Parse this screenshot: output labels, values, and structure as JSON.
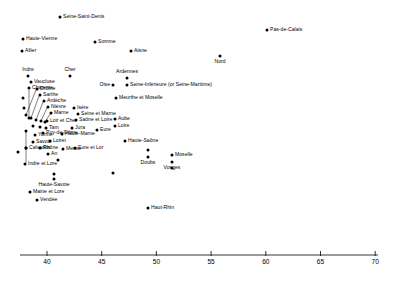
{
  "chart_data": {
    "type": "scatter",
    "title": "",
    "xlabel": "",
    "ylabel": "",
    "xlim": [
      38.0,
      71.0
    ],
    "ylim": [
      0,
      1
    ],
    "grid": false,
    "legend": null,
    "axis_ticks": [
      40,
      45,
      50,
      55,
      60,
      65,
      70
    ],
    "axis_tick_labels": [
      "40",
      "45",
      "50",
      "55",
      "60",
      "65",
      "70"
    ],
    "note": "One-dimensional dot plot of French departments; vertical position is label-placement jitter only, horizontal position is the measured value.",
    "points": [
      {
        "label": "Seine-Saint-Denis",
        "x": 44.3,
        "px": 60,
        "py": 17,
        "side": "right"
      },
      {
        "label": "Haute-Vienne",
        "x": 40.7,
        "px": 23,
        "py": 39,
        "side": "right"
      },
      {
        "label": "Somme",
        "x": 48.0,
        "px": 95,
        "py": 42,
        "side": "right"
      },
      {
        "label": "Allier",
        "x": 40.5,
        "px": 22,
        "py": 51,
        "side": "right"
      },
      {
        "label": "Aisne",
        "x": 51.4,
        "px": 131,
        "py": 51,
        "side": "right"
      },
      {
        "label": "Nord",
        "x": 56.1,
        "px": 220,
        "py": 56,
        "side": "below"
      },
      {
        "label": "Pas-de-Calais",
        "x": 60.6,
        "px": 267,
        "py": 30,
        "side": "right"
      },
      {
        "label": "Indre",
        "x": 40.2,
        "px": 28,
        "py": 76,
        "side": "above"
      },
      {
        "label": "Cher",
        "x": 44.3,
        "px": 70,
        "py": 76,
        "side": "above"
      },
      {
        "label": "Vaucluse",
        "x": 40.4,
        "px": 31,
        "py": 82,
        "side": "right"
      },
      {
        "label": "Ardennes",
        "x": 52.3,
        "px": 127,
        "py": 78,
        "side": "above"
      },
      {
        "label": "Oise",
        "x": 51.0,
        "px": 113,
        "py": 85,
        "side": "left"
      },
      {
        "label": "Seine-Inférieure (or Seine-Maritime)",
        "x": 52.3,
        "px": 127,
        "py": 85,
        "side": "right"
      },
      {
        "label": "Charente",
        "x": 40.3,
        "px": 29,
        "py": 88,
        "side": "leader-v"
      },
      {
        "label": "Drôme",
        "x": 41.2,
        "px": 37,
        "py": 89,
        "side": "leader"
      },
      {
        "label": "Sarthe",
        "x": 41.4,
        "px": 40,
        "py": 95,
        "side": "leader"
      },
      {
        "label": "Meurthe et Moselle",
        "x": 51.2,
        "px": 116,
        "py": 98,
        "side": "right"
      },
      {
        "label": "Ardèche",
        "x": 41.8,
        "px": 44,
        "py": 101,
        "side": "leader"
      },
      {
        "label": "Nièvre",
        "x": 42.1,
        "px": 48,
        "py": 107,
        "side": "leader"
      },
      {
        "label": "Isère",
        "x": 44.6,
        "px": 74,
        "py": 108,
        "side": "right"
      },
      {
        "label": "Marne",
        "x": 42.4,
        "px": 51,
        "py": 113,
        "side": "leader"
      },
      {
        "label": "Seine et Marne",
        "x": 45.0,
        "px": 78,
        "py": 114,
        "side": "right"
      },
      {
        "label": "Loir et Cher",
        "x": 42.0,
        "px": 47,
        "py": 121,
        "side": "right"
      },
      {
        "label": "Saône et Loire",
        "x": 44.8,
        "px": 76,
        "py": 120,
        "side": "right"
      },
      {
        "label": "Aube",
        "x": 48.3,
        "px": 115,
        "py": 119,
        "side": "right"
      },
      {
        "label": "Loire",
        "x": 48.3,
        "px": 115,
        "py": 126,
        "side": "right"
      },
      {
        "label": "Tam",
        "x": 41.9,
        "px": 46,
        "py": 128,
        "side": "right"
      },
      {
        "label": "Jura",
        "x": 44.3,
        "px": 72,
        "py": 128,
        "side": "right"
      },
      {
        "label": "Eure",
        "x": 46.7,
        "px": 97,
        "py": 130,
        "side": "right"
      },
      {
        "label": "Yonne",
        "x": 40.9,
        "px": 35,
        "py": 135,
        "side": "right"
      },
      {
        "label": "Puy-de-Dôme",
        "x": 41.7,
        "px": 43,
        "py": 133,
        "side": "right"
      },
      {
        "label": "Haute-Marne",
        "x": 43.3,
        "px": 62,
        "py": 134,
        "side": "right"
      },
      {
        "label": "Savoie",
        "x": 40.7,
        "px": 33,
        "py": 142,
        "side": "right"
      },
      {
        "label": "Loiret",
        "x": 42.3,
        "px": 50,
        "py": 141,
        "side": "right"
      },
      {
        "label": "Haute-Saône",
        "x": 49.3,
        "px": 125,
        "py": 141,
        "side": "right"
      },
      {
        "label": "Rhône",
        "x": 41.4,
        "px": 40,
        "py": 148,
        "side": "right"
      },
      {
        "label": "Meuse",
        "x": 43.4,
        "px": 63,
        "py": 149,
        "side": "right"
      },
      {
        "label": "Eure et Lor",
        "x": 44.7,
        "px": 75,
        "py": 148,
        "side": "right"
      },
      {
        "label": "An",
        "x": 42.1,
        "px": 48,
        "py": 154,
        "side": "right"
      },
      {
        "label": "Calvados",
        "x": 40.0,
        "px": 26,
        "py": 148,
        "side": "leader-v"
      },
      {
        "label": "Moselle",
        "x": 54.4,
        "px": 172,
        "py": 155,
        "side": "right"
      },
      {
        "label": "Doubs",
        "x": 51.5,
        "px": 148,
        "py": 157,
        "side": "below"
      },
      {
        "label": "Vosges",
        "x": 54.4,
        "px": 172,
        "py": 162,
        "side": "below"
      },
      {
        "label": "Indre et Lore",
        "x": 39.9,
        "px": 25,
        "py": 164,
        "side": "leader-v"
      },
      {
        "label": "Haute-Savoie",
        "x": 42.6,
        "px": 54,
        "py": 179,
        "side": "below"
      },
      {
        "label": "Maine et Lore",
        "x": 40.4,
        "px": 30,
        "py": 192,
        "side": "right"
      },
      {
        "label": "Vendée",
        "x": 41.1,
        "px": 37,
        "py": 200,
        "side": "right"
      },
      {
        "label": "Haut-Rhin",
        "x": 51.2,
        "px": 148,
        "py": 208,
        "side": "right"
      }
    ],
    "leaders": [
      {
        "label": "Drôme",
        "lx": 36,
        "ly": 90,
        "px": 26,
        "py": 115
      },
      {
        "label": "Sarthe",
        "lx": 39,
        "ly": 96,
        "px": 31,
        "py": 118
      },
      {
        "label": "Ardèche",
        "lx": 43,
        "ly": 102,
        "px": 36,
        "py": 120
      },
      {
        "label": "Nièvre",
        "lx": 47,
        "ly": 108,
        "px": 41,
        "py": 121
      },
      {
        "label": "Marne",
        "lx": 50,
        "ly": 114,
        "px": 45,
        "py": 122
      },
      {
        "label": "Charente",
        "lx": 29,
        "ly": 90,
        "px": 29,
        "py": 118
      },
      {
        "label": "Calvados",
        "lx": 26,
        "ly": 147,
        "px": 26,
        "py": 131
      },
      {
        "label": "Indre et Lore",
        "lx": 26,
        "ly": 163,
        "px": 26,
        "py": 148
      }
    ],
    "extra_points_px": [
      {
        "px": 26,
        "py": 115
      },
      {
        "px": 31,
        "py": 118
      },
      {
        "px": 36,
        "py": 120
      },
      {
        "px": 41,
        "py": 121
      },
      {
        "px": 45,
        "py": 122
      },
      {
        "px": 29,
        "py": 118
      },
      {
        "px": 26,
        "py": 131
      },
      {
        "px": 26,
        "py": 148
      },
      {
        "px": 33,
        "py": 126
      },
      {
        "px": 40,
        "py": 127
      },
      {
        "px": 23,
        "py": 98
      },
      {
        "px": 24,
        "py": 108
      },
      {
        "px": 58,
        "py": 160
      },
      {
        "px": 148,
        "py": 150
      },
      {
        "px": 172,
        "py": 168
      },
      {
        "px": 54,
        "py": 174
      },
      {
        "px": 18,
        "py": 152
      },
      {
        "px": 113,
        "py": 173
      }
    ]
  },
  "axis": {
    "start_px": 20,
    "end_px": 378,
    "y_px": 255,
    "tick_len": 5,
    "first_value": 40,
    "first_px": 47,
    "px_per_unit": 10.94
  }
}
